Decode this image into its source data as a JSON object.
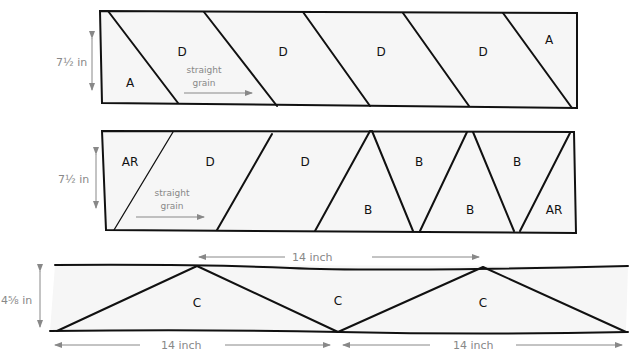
{
  "diagram": {
    "strip1": {
      "height_label": "7½ in",
      "grain_label_line1": "straight",
      "grain_label_line2": "grain",
      "pieces": [
        "A",
        "D",
        "D",
        "D",
        "D",
        "A"
      ]
    },
    "strip2": {
      "height_label": "7½ in",
      "grain_label_line1": "straight",
      "grain_label_line2": "grain",
      "pieces": [
        "AR",
        "D",
        "D",
        "B",
        "B",
        "B",
        "B",
        "AR"
      ]
    },
    "strip3": {
      "height_label": "4⅝ in",
      "top_dimension": "14 inch",
      "bottom_dimension_left": "14 inch",
      "bottom_dimension_right": "14 inch",
      "pieces": [
        "C",
        "C",
        "C"
      ]
    }
  }
}
